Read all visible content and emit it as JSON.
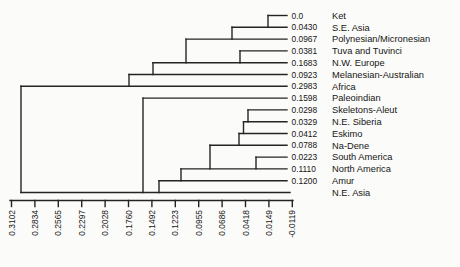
{
  "figure": {
    "background_color": "#fbfbf9",
    "line_color": "#242424",
    "text_color": "#161616"
  },
  "chart_data": {
    "type": "dendrogram",
    "orientation": "horizontal, leaves on right, root on left",
    "title": "",
    "leaves": [
      {
        "label": "Ket",
        "value": "0.0"
      },
      {
        "label": "S.E. Asia",
        "value": "0.0430"
      },
      {
        "label": "Polynesian/Micronesian",
        "value": "0.0967"
      },
      {
        "label": "Tuva and Tuvinci",
        "value": "0.0381"
      },
      {
        "label": "N.W. Europe",
        "value": "0.1683"
      },
      {
        "label": "Melanesian-Australian",
        "value": "0.0923"
      },
      {
        "label": "Africa",
        "value": "0.2983"
      },
      {
        "label": "Paleoindian",
        "value": "0.1598"
      },
      {
        "label": "Skeletons-Aleut",
        "value": "0.0298"
      },
      {
        "label": "N.E. Siberia",
        "value": "0.0329"
      },
      {
        "label": "Eskimo",
        "value": "0.0412"
      },
      {
        "label": "Na-Dene",
        "value": "0.0788"
      },
      {
        "label": "South America",
        "value": "0.0223"
      },
      {
        "label": "North America",
        "value": "0.1110"
      },
      {
        "label": "Amur",
        "value": "0.1200"
      },
      {
        "label": "N.E. Asia",
        "value": ""
      }
    ],
    "newick": "((((((Ket,S.E. Asia),Polynesian/Micronesian),(Tuva and Tuvinci,N.W. Europe)),Melanesian-Australian),Africa),(Paleoindian,((((((Skeletons-Aleut,N.E. Siberia),Eskimo),Na-Dene),(South America,North America)),Amur),N.E. Asia)))",
    "axis": {
      "position": "bottom",
      "tick_labels": [
        "0.3102",
        "0.2834",
        "0.2565",
        "0.2297",
        "0.2028",
        "0.1760",
        "0.1492",
        "0.1223",
        "0.0955",
        "0.0686",
        "0.0418",
        "0.0149",
        "-0.0119"
      ],
      "label_rotation_deg": -90,
      "range": [
        0.3102,
        -0.0119
      ],
      "grid": false
    }
  }
}
